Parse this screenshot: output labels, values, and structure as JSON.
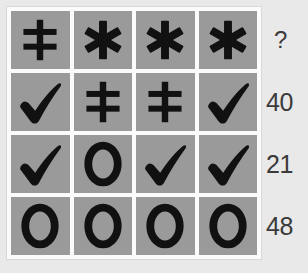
{
  "puzzle": {
    "type": "matrix-reasoning-grid",
    "rows": 4,
    "columns": 4,
    "colors": {
      "cell_background": "#9a9a9a",
      "grid_line": "#fbfbfb",
      "symbol": "#111111",
      "label_text": "#3a3a3a",
      "page_background": "#e9e9e9"
    },
    "symbol_names": {
      "dagger": "double-dagger-icon",
      "asterisk": "asterisk-icon",
      "check": "checkmark-icon",
      "ring": "ring-o-icon"
    },
    "grid": [
      {
        "row_index": 1,
        "cells": [
          "dagger",
          "asterisk",
          "asterisk",
          "asterisk"
        ],
        "label": "?"
      },
      {
        "row_index": 2,
        "cells": [
          "check",
          "dagger",
          "dagger",
          "check"
        ],
        "label": "40"
      },
      {
        "row_index": 3,
        "cells": [
          "check",
          "ring",
          "check",
          "check"
        ],
        "label": "21"
      },
      {
        "row_index": 4,
        "cells": [
          "ring",
          "ring",
          "ring",
          "ring"
        ],
        "label": "48"
      }
    ],
    "labels": [
      "?",
      "40",
      "21",
      "48"
    ]
  }
}
